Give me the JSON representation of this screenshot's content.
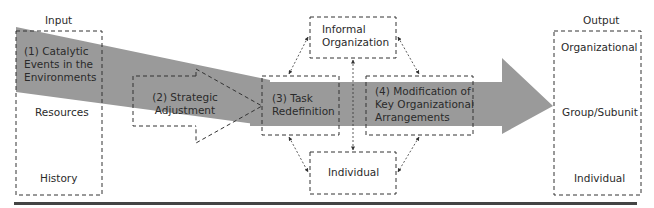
{
  "diagram": {
    "input": {
      "header": "Input",
      "items": [
        "(1) Catalytic",
        "Events in the",
        "Environments"
      ],
      "resources": "Resources",
      "history": "History"
    },
    "strategic": {
      "line1": "(2) Strategic",
      "line2": "Adjustment"
    },
    "task": {
      "line1": "(3) Task",
      "line2": "Redefinition"
    },
    "modification": {
      "line1": "(4) Modification of",
      "line2": "Key Organizational",
      "line3": "Arrangements"
    },
    "informal": {
      "line1": "Informal",
      "line2": "Organization"
    },
    "individual_mid": "Individual",
    "output": {
      "header": "Output",
      "organizational": "Organizational",
      "group": "Group/Subunit",
      "individual": "Individual"
    },
    "colors": {
      "arrow_fill": "#9a9a9a",
      "line": "#333333",
      "rule": "#444444"
    }
  }
}
